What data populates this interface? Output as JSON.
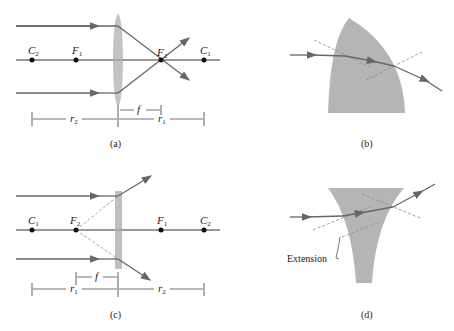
{
  "panels": {
    "a": {
      "caption": "(a)",
      "points": [
        "C2",
        "F1",
        "F2",
        "C1"
      ],
      "dims": {
        "f": "f",
        "r2": "r2",
        "r1": "r1"
      }
    },
    "b": {
      "caption": "(b)"
    },
    "c": {
      "caption": "(c)",
      "points": [
        "C1",
        "F2",
        "F1",
        "C2"
      ],
      "dims": {
        "f": "f",
        "r1": "r1",
        "r2": "r2"
      }
    },
    "d": {
      "caption": "(d)",
      "label": "Extension"
    }
  },
  "text": {
    "C": "C",
    "F": "F",
    "f": "f",
    "r": "r",
    "one": "1",
    "two": "2",
    "cap_a": "(a)",
    "cap_b": "(b)",
    "cap_c": "(c)",
    "cap_d": "(d)",
    "extension": "Extension"
  },
  "colors": {
    "ray": "#666666",
    "lens": "#a8a8a8",
    "glass": "#b5b5b5",
    "axis": "#333333"
  }
}
